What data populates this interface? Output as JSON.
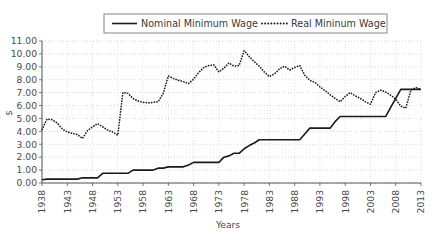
{
  "chart_data": {
    "type": "line",
    "title": "",
    "xlabel": "Years",
    "ylabel": "$",
    "xlim": [
      1938,
      2013
    ],
    "ylim": [
      0,
      11
    ],
    "ytick_step": 1,
    "ytick_format": "0.00",
    "xtick_step": 5,
    "grid": true,
    "grid_style": "dotted",
    "legend_position": "top-center",
    "yticks": [
      "11.00",
      "10.00",
      "9.00",
      "8.00",
      "7.00",
      "6.00",
      "5.00",
      "4.00",
      "3.00",
      "2.00",
      "1.00",
      "0.00"
    ],
    "xticks": [
      "1938",
      "1943",
      "1948",
      "1953",
      "1958",
      "1963",
      "1968",
      "1973",
      "1978",
      "1983",
      "1988",
      "1993",
      "1998",
      "2003",
      "2008",
      "2013"
    ],
    "x": [
      1938,
      1939,
      1940,
      1941,
      1942,
      1943,
      1944,
      1945,
      1946,
      1947,
      1948,
      1949,
      1950,
      1951,
      1952,
      1953,
      1954,
      1955,
      1956,
      1957,
      1958,
      1959,
      1960,
      1961,
      1962,
      1963,
      1964,
      1965,
      1966,
      1967,
      1968,
      1969,
      1970,
      1971,
      1972,
      1973,
      1974,
      1975,
      1976,
      1977,
      1978,
      1979,
      1980,
      1981,
      1982,
      1983,
      1984,
      1985,
      1986,
      1987,
      1988,
      1989,
      1990,
      1991,
      1992,
      1993,
      1994,
      1995,
      1996,
      1997,
      1998,
      1999,
      2000,
      2001,
      2002,
      2003,
      2004,
      2005,
      2006,
      2007,
      2008,
      2009,
      2010,
      2011,
      2012,
      2013
    ],
    "series": [
      {
        "name": "Nominal Minimum Wage",
        "style": "solid",
        "color": "#1a1a1a",
        "values": [
          0.25,
          0.3,
          0.3,
          0.3,
          0.3,
          0.3,
          0.3,
          0.3,
          0.4,
          0.4,
          0.4,
          0.4,
          0.75,
          0.75,
          0.75,
          0.75,
          0.75,
          0.75,
          1.0,
          1.0,
          1.0,
          1.0,
          1.0,
          1.15,
          1.15,
          1.25,
          1.25,
          1.25,
          1.25,
          1.4,
          1.6,
          1.6,
          1.6,
          1.6,
          1.6,
          1.6,
          2.0,
          2.1,
          2.3,
          2.3,
          2.65,
          2.9,
          3.1,
          3.35,
          3.35,
          3.35,
          3.35,
          3.35,
          3.35,
          3.35,
          3.35,
          3.35,
          3.8,
          4.25,
          4.25,
          4.25,
          4.25,
          4.25,
          4.75,
          5.15,
          5.15,
          5.15,
          5.15,
          5.15,
          5.15,
          5.15,
          5.15,
          5.15,
          5.15,
          5.85,
          6.55,
          7.25,
          7.25,
          7.25,
          7.25,
          7.25
        ]
      },
      {
        "name": "Real Mininum Wage",
        "style": "dotted",
        "color": "#1a1a1a",
        "values": [
          4.15,
          4.95,
          4.9,
          4.65,
          4.2,
          3.95,
          3.85,
          3.75,
          3.45,
          4.05,
          4.35,
          4.6,
          4.35,
          4.1,
          3.95,
          3.7,
          7.0,
          6.95,
          6.55,
          6.35,
          6.25,
          6.2,
          6.25,
          6.3,
          6.95,
          8.3,
          8.1,
          7.95,
          7.85,
          7.7,
          8.05,
          8.55,
          8.95,
          9.1,
          9.15,
          8.6,
          8.9,
          9.3,
          9.05,
          9.1,
          10.25,
          9.8,
          9.4,
          9.05,
          8.6,
          8.25,
          8.45,
          8.85,
          9.05,
          8.75,
          8.95,
          9.1,
          8.35,
          7.95,
          7.8,
          7.45,
          7.15,
          6.85,
          6.55,
          6.3,
          6.7,
          7.0,
          6.75,
          6.55,
          6.3,
          6.1,
          7.0,
          7.2,
          7.05,
          6.8,
          6.5,
          5.95,
          5.8,
          7.2,
          7.4,
          7.25
        ]
      }
    ]
  },
  "legend": {
    "items": [
      {
        "label": "Nominal Minimum Wage",
        "style": "solid"
      },
      {
        "label": "Real Mininum Wage",
        "style": "dotted"
      }
    ]
  },
  "axes": {
    "y_label": "$",
    "x_label": "Years"
  }
}
